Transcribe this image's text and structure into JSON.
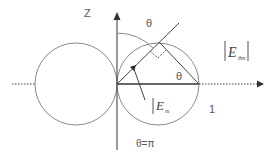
{
  "diagram": {
    "labels": {
      "z_axis": "Z",
      "theta_top": "θ",
      "theta_inner": "θ",
      "theta_pi": "θ=π",
      "e_total": "E",
      "e_total_sub": "θm",
      "e_radial": "E",
      "e_radial_sub": "m",
      "unit_one": "1"
    },
    "colors": {
      "stroke": "#888888",
      "axis": "#555555",
      "text": "#555555",
      "background": "#ffffff"
    },
    "geometry": {
      "origin": [
        117,
        84
      ],
      "circle_radius": 41,
      "left_circle_center": [
        76,
        84
      ],
      "right_circle_center": [
        158,
        84
      ]
    }
  }
}
